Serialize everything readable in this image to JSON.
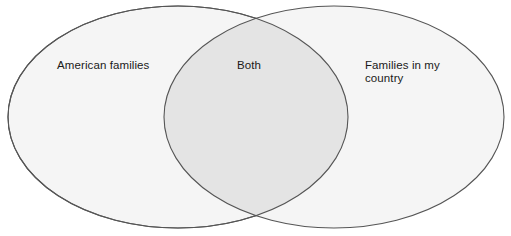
{
  "figure": {
    "type": "venn-diagram",
    "background_color": "#ffffff",
    "sets": [
      {
        "id": "left",
        "label": "American families",
        "fill_color": "#f5f5f5",
        "stroke_color": "#555555"
      },
      {
        "id": "right",
        "label": "Families in my\ncountry",
        "fill_color": "#f5f5f5",
        "stroke_color": "#555555"
      }
    ],
    "intersection": {
      "id": "both",
      "label": "Both",
      "fill_color": "#e4e4e4"
    },
    "geometry": {
      "left_ellipse": {
        "cx": 178,
        "cy": 117,
        "rx": 170,
        "ry": 111
      },
      "right_ellipse": {
        "cx": 334,
        "cy": 117,
        "rx": 170,
        "ry": 111
      },
      "stroke_width": 1.1
    }
  }
}
